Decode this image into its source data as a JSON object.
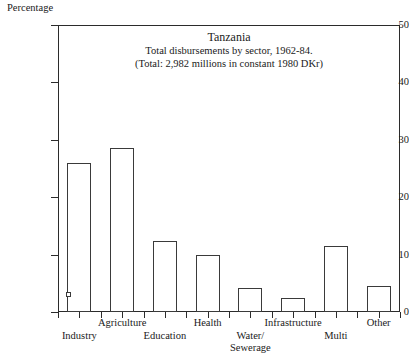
{
  "chart_data": {
    "type": "bar",
    "title": "Tanzania",
    "subtitles": [
      "Total disbursements by sector, 1962-84.",
      "(Total: 2,982 millions in constant 1980 DKr)"
    ],
    "xlabel": "",
    "ylabel": "Percentage",
    "ylim": [
      0,
      50
    ],
    "yticks": [
      0,
      10,
      20,
      30,
      40,
      50
    ],
    "ytick_labels": [
      "0",
      "10",
      "20",
      "30",
      "40",
      "50"
    ],
    "grid": false,
    "legend": "none",
    "categories": [
      "Industry",
      "Agriculture",
      "Education",
      "Health",
      "Water/ Sewerage",
      "Infrastructure",
      "Multi",
      "Other"
    ],
    "category_labels": [
      {
        "text": "Industry",
        "row": 1
      },
      {
        "text": "Agriculture",
        "row": 0
      },
      {
        "text": "Education",
        "row": 1
      },
      {
        "text": "Health",
        "row": 0
      },
      {
        "text": "Water/ Sewerage",
        "row": 1
      },
      {
        "text": "Infrastructure",
        "row": 0
      },
      {
        "text": "Multi",
        "row": 1
      },
      {
        "text": "Other",
        "row": 0
      }
    ],
    "values": [
      26,
      28.5,
      12.3,
      10,
      4.1,
      2.4,
      11.5,
      4.5
    ],
    "annotations": [
      {
        "name": "industry-marker",
        "category": "Industry",
        "value": 3,
        "shape": "open-square"
      }
    ],
    "bar_style": {
      "fill": "#ffffff",
      "stroke": "#3a3a3a"
    },
    "axis_color": "#2b2b2b"
  }
}
